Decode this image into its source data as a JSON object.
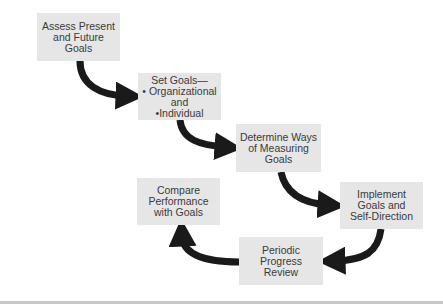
{
  "diagram": {
    "type": "cyclic process flow",
    "steps": [
      {
        "id": 1,
        "label": "Assess Present\nand Future\nGoals"
      },
      {
        "id": 2,
        "label": "Set Goals—\n• Organizational\nand\n•Individual"
      },
      {
        "id": 3,
        "label": "Determine Ways\nof Measuring\nGoals"
      },
      {
        "id": 4,
        "label": "Implement\nGoals and\nSelf-Direction"
      },
      {
        "id": 5,
        "label": "Periodic\nProgress\nReview"
      },
      {
        "id": 6,
        "label": "Compare\nPerformance\nwith Goals"
      }
    ],
    "edges": [
      {
        "from": 1,
        "to": 2
      },
      {
        "from": 2,
        "to": 3
      },
      {
        "from": 3,
        "to": 4
      },
      {
        "from": 4,
        "to": 5
      },
      {
        "from": 5,
        "to": 6
      }
    ],
    "colors": {
      "box_fill": "#e6e6e6",
      "arrow": "#1a1a1a",
      "text": "#3a3a3a",
      "rule": "#c8c8c8"
    }
  }
}
